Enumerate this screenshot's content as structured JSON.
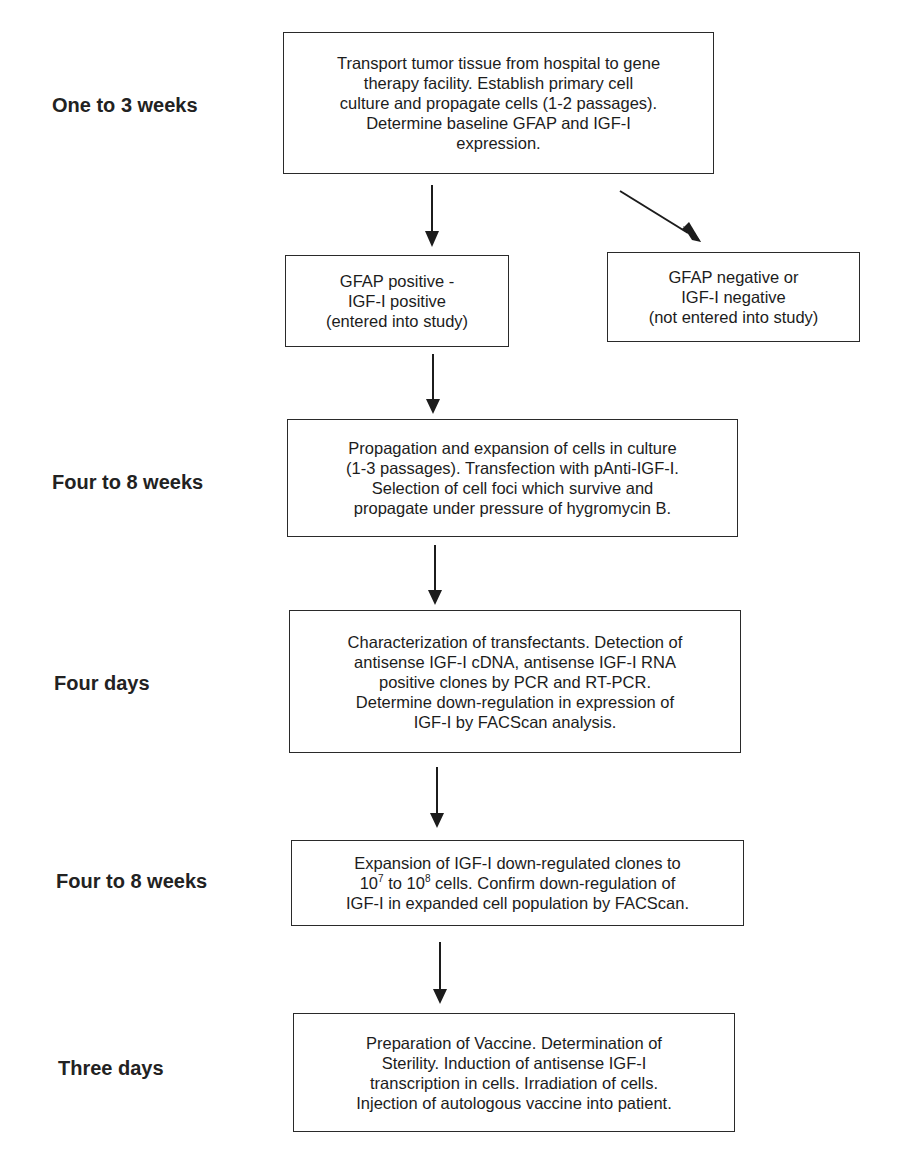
{
  "stages": [
    {
      "label": "One to 3 weeks"
    },
    {
      "label": "Four to 8 weeks"
    },
    {
      "label": "Four days"
    },
    {
      "label": "Four to 8 weeks"
    },
    {
      "label": "Three days"
    }
  ],
  "boxes": {
    "transport": {
      "lines": [
        "Transport tumor tissue from hospital to gene",
        "therapy facility.  Establish primary cell",
        "culture and propagate cells (1-2 passages).",
        "Determine baseline GFAP and IGF-I",
        "expression."
      ]
    },
    "positive": {
      "lines": [
        "GFAP positive -",
        "IGF-I positive",
        "(entered into study)"
      ]
    },
    "negative": {
      "lines": [
        "GFAP negative or",
        "IGF-I negative",
        "(not entered into study)"
      ]
    },
    "propagation": {
      "lines": [
        "Propagation and expansion of cells in culture",
        "(1-3 passages).  Transfection with pAnti-IGF-I.",
        "Selection of cell foci which survive and",
        "propagate under pressure of hygromycin B."
      ]
    },
    "characterization": {
      "lines": [
        "Characterization of transfectants.  Detection of",
        "antisense IGF-I cDNA, antisense IGF-I RNA",
        "positive clones by PCR and RT-PCR.",
        "Determine down-regulation in expression of",
        "IGF-I by FACScan analysis."
      ]
    },
    "expansion": {
      "line1": "Expansion of IGF-I down-regulated clones to",
      "line2_a": "10",
      "line2_exp1": "7",
      "line2_b": " to 10",
      "line2_exp2": "8",
      "line2_c": " cells.  Confirm down-regulation of",
      "line3": "IGF-I in expanded cell population by FACScan."
    },
    "vaccine": {
      "lines": [
        "Preparation of Vaccine.  Determination of",
        "Sterility.  Induction of antisense IGF-I",
        "transcription in cells. Irradiation of cells.",
        "Injection of autologous vaccine into patient."
      ]
    }
  },
  "colors": {
    "stroke": "#1c1c1c",
    "background": "#ffffff"
  }
}
